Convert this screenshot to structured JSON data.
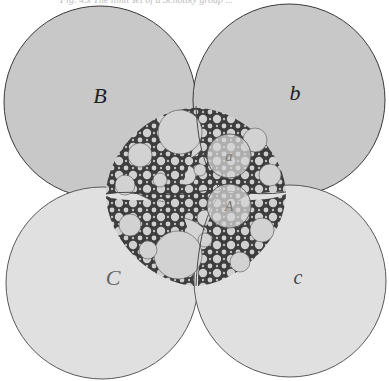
{
  "caption": "Fig. 4.x  The limit set of a Schottky group ...",
  "colors": {
    "dark_disk": "#c9c9c9",
    "light_disk": "#dedede",
    "stroke": "#4a4a4a",
    "fractal_bg": "#3a3a3a",
    "fractal_disk": "#d2d2d2",
    "gap": "#ffffff"
  },
  "circles": [
    {
      "id": "B",
      "label": "B",
      "cx": 100,
      "cy": 102,
      "r": 96,
      "fill": "dark"
    },
    {
      "id": "b",
      "label": "b",
      "cx": 289,
      "cy": 100,
      "r": 96,
      "fill": "dark"
    },
    {
      "id": "C",
      "label": "C",
      "cx": 102,
      "cy": 283,
      "r": 96,
      "fill": "light"
    },
    {
      "id": "c",
      "label": "c",
      "cx": 290,
      "cy": 281,
      "r": 96,
      "fill": "light"
    }
  ],
  "small_circles": [
    {
      "id": "a",
      "label": "a",
      "cx": 229,
      "cy": 156,
      "r": 22
    },
    {
      "id": "A",
      "label": "A",
      "cx": 229,
      "cy": 206,
      "r": 22
    }
  ],
  "labels": {
    "B": "B",
    "b": "b",
    "C": "C",
    "c": "c",
    "a": "a",
    "A": "A"
  }
}
